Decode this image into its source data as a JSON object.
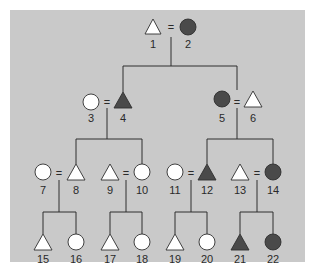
{
  "diagram": {
    "type": "pedigree-chart",
    "colors": {
      "panel_background": "#c9c9c9",
      "affected_fill": "#4a4a4a",
      "unaffected_fill": "#ffffff",
      "line": "#2f2f2f"
    },
    "legend": {
      "triangle": "male",
      "circle": "female",
      "filled": "affected",
      "open": "unaffected",
      "equals_sign": "mating"
    },
    "marriage_symbol": "=",
    "individuals": [
      {
        "id": "1",
        "label": "1",
        "shape": "triangle",
        "affected": false,
        "generation": 1
      },
      {
        "id": "2",
        "label": "2",
        "shape": "circle",
        "affected": true,
        "generation": 1
      },
      {
        "id": "3",
        "label": "3",
        "shape": "circle",
        "affected": false,
        "generation": 2
      },
      {
        "id": "4",
        "label": "4",
        "shape": "triangle",
        "affected": true,
        "generation": 2
      },
      {
        "id": "5",
        "label": "5",
        "shape": "circle",
        "affected": true,
        "generation": 2
      },
      {
        "id": "6",
        "label": "6",
        "shape": "triangle",
        "affected": false,
        "generation": 2
      },
      {
        "id": "7",
        "label": "7",
        "shape": "circle",
        "affected": false,
        "generation": 3
      },
      {
        "id": "8",
        "label": "8",
        "shape": "triangle",
        "affected": false,
        "generation": 3
      },
      {
        "id": "9",
        "label": "9",
        "shape": "triangle",
        "affected": false,
        "generation": 3
      },
      {
        "id": "10",
        "label": "10",
        "shape": "circle",
        "affected": false,
        "generation": 3
      },
      {
        "id": "11",
        "label": "11",
        "shape": "circle",
        "affected": false,
        "generation": 3
      },
      {
        "id": "12",
        "label": "12",
        "shape": "triangle",
        "affected": true,
        "generation": 3
      },
      {
        "id": "13",
        "label": "13",
        "shape": "triangle",
        "affected": false,
        "generation": 3
      },
      {
        "id": "14",
        "label": "14",
        "shape": "circle",
        "affected": true,
        "generation": 3
      },
      {
        "id": "15",
        "label": "15",
        "shape": "triangle",
        "affected": false,
        "generation": 4
      },
      {
        "id": "16",
        "label": "16",
        "shape": "circle",
        "affected": false,
        "generation": 4
      },
      {
        "id": "17",
        "label": "17",
        "shape": "triangle",
        "affected": false,
        "generation": 4
      },
      {
        "id": "18",
        "label": "18",
        "shape": "circle",
        "affected": false,
        "generation": 4
      },
      {
        "id": "19",
        "label": "19",
        "shape": "triangle",
        "affected": false,
        "generation": 4
      },
      {
        "id": "20",
        "label": "20",
        "shape": "circle",
        "affected": false,
        "generation": 4
      },
      {
        "id": "21",
        "label": "21",
        "shape": "triangle",
        "affected": true,
        "generation": 4
      },
      {
        "id": "22",
        "label": "22",
        "shape": "circle",
        "affected": true,
        "generation": 4
      }
    ],
    "matings": [
      {
        "partners": [
          "1",
          "2"
        ],
        "children": [
          "4",
          "5"
        ]
      },
      {
        "partners": [
          "3",
          "4"
        ],
        "children": [
          "8",
          "10"
        ]
      },
      {
        "partners": [
          "5",
          "6"
        ],
        "children": [
          "12",
          "14"
        ]
      },
      {
        "partners": [
          "7",
          "8"
        ],
        "children": [
          "15",
          "16"
        ]
      },
      {
        "partners": [
          "9",
          "10"
        ],
        "children": [
          "17",
          "18"
        ]
      },
      {
        "partners": [
          "11",
          "12"
        ],
        "children": [
          "19",
          "20"
        ]
      },
      {
        "partners": [
          "13",
          "14"
        ],
        "children": [
          "21",
          "22"
        ]
      }
    ]
  }
}
